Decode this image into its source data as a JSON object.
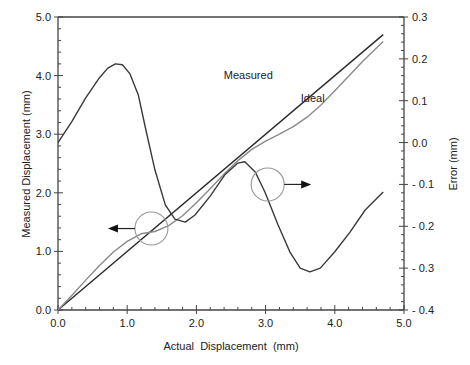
{
  "chart_data": {
    "type": "line",
    "title": "",
    "xlabel": "Actual  Displacement  (mm)",
    "ylabel": "Measured Displacement (mm)",
    "y2label": "Error (mm)",
    "xlim": [
      0,
      5
    ],
    "ylim": [
      0,
      5
    ],
    "y2lim": [
      -0.4,
      0.3
    ],
    "grid": false,
    "legend": "none",
    "x_ticks": [
      "0.0",
      "1.0",
      "2.0",
      "3.0",
      "4.0",
      "5.0"
    ],
    "y_ticks": [
      "0.0",
      "1.0",
      "2.0",
      "3.0",
      "4.0",
      "5.0"
    ],
    "y2_ticks": [
      "0.3",
      "0.2",
      "0.1",
      "0.0",
      "- 0.1",
      "- 0.2",
      "- 0.3",
      "- 0.4"
    ],
    "series": [
      {
        "name": "Ideal",
        "axis": "left",
        "color": "#2a2a2a",
        "x": [
          0.0,
          4.7
        ],
        "values": [
          0.0,
          4.7
        ]
      },
      {
        "name": "Measured",
        "axis": "left",
        "color": "#8a8a8a",
        "x": [
          0.0,
          0.2,
          0.4,
          0.6,
          0.8,
          1.0,
          1.2,
          1.4,
          1.6,
          1.8,
          2.0,
          2.2,
          2.4,
          2.6,
          2.8,
          3.0,
          3.2,
          3.4,
          3.6,
          3.8,
          4.0,
          4.2,
          4.4,
          4.7
        ],
        "values": [
          0.0,
          0.25,
          0.51,
          0.76,
          0.99,
          1.17,
          1.3,
          1.34,
          1.44,
          1.61,
          1.83,
          2.07,
          2.32,
          2.55,
          2.74,
          2.88,
          3.0,
          3.13,
          3.29,
          3.5,
          3.74,
          3.99,
          4.24,
          4.58
        ]
      },
      {
        "name": "Error",
        "axis": "right",
        "color": "#3a3a3a",
        "x": [
          0.0,
          0.2,
          0.4,
          0.6,
          0.72,
          0.83,
          0.93,
          1.04,
          1.16,
          1.27,
          1.4,
          1.55,
          1.69,
          1.84,
          1.98,
          2.2,
          2.41,
          2.6,
          2.7,
          2.85,
          2.99,
          3.18,
          3.35,
          3.5,
          3.64,
          3.79,
          4.0,
          4.22,
          4.44,
          4.7
        ],
        "values": [
          0.0,
          0.05,
          0.107,
          0.155,
          0.178,
          0.188,
          0.186,
          0.164,
          0.114,
          0.03,
          -0.065,
          -0.149,
          -0.183,
          -0.19,
          -0.173,
          -0.128,
          -0.077,
          -0.049,
          -0.046,
          -0.07,
          -0.118,
          -0.197,
          -0.261,
          -0.3,
          -0.309,
          -0.3,
          -0.261,
          -0.214,
          -0.161,
          -0.118
        ]
      }
    ],
    "annotations": [
      {
        "text": "Measured",
        "x": 2.75,
        "y": 3.95
      },
      {
        "text": "Ideal",
        "x": 3.68,
        "y": 3.55
      },
      {
        "type": "circle-arrow",
        "target_axis": "left",
        "circle_center": [
          1.35,
          1.39
        ],
        "arrow_direction": "left"
      },
      {
        "type": "circle-arrow",
        "target_axis": "right",
        "circle_center": [
          3.03,
          -0.1
        ],
        "arrow_direction": "right"
      }
    ]
  }
}
